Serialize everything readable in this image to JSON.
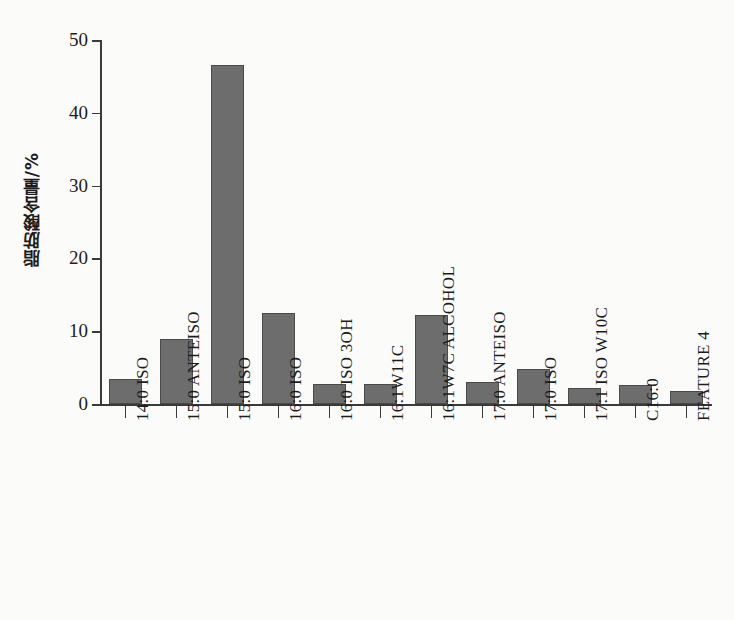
{
  "chart_data": {
    "type": "bar",
    "title": "",
    "xlabel": "",
    "ylabel": "脂肪酸含量/%",
    "ylim": [
      0,
      50
    ],
    "yticks": [
      0,
      10,
      20,
      30,
      40,
      50
    ],
    "grid": false,
    "legend": null,
    "bar_color": "#6d6d6d",
    "bar_edge_color": "#4a4a4a",
    "background_color": "#fbfbf9",
    "axis_color": "#3a3a3a",
    "categories": [
      "14:0 ISO",
      "15:0 ANTEISO",
      "15:0 ISO",
      "16:0 ISO",
      "16:0 ISO 3OH",
      "16:1W11C",
      "16:1W7C ALCOHOL",
      "17:0 ANTEISO",
      "17:0 ISO",
      "17:1 ISO W10C",
      "C16:0",
      "FEATURE 4"
    ],
    "values": [
      3.5,
      8.9,
      46.5,
      12.5,
      2.8,
      2.8,
      12.2,
      3.0,
      4.8,
      2.2,
      2.6,
      1.8
    ]
  }
}
